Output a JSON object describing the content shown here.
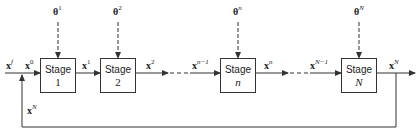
{
  "diagram": {
    "type": "multistage-process-flow",
    "stages": [
      {
        "label": "Stage",
        "index": "1",
        "italic": false,
        "input_param": {
          "base": "θ",
          "sup": "1"
        }
      },
      {
        "label": "Stage",
        "index": "2",
        "italic": false,
        "input_param": {
          "base": "θ",
          "sup": "2"
        }
      },
      {
        "label": "Stage",
        "index": "n",
        "italic": true,
        "input_param": {
          "base": "θ",
          "sup": "n"
        }
      },
      {
        "label": "Stage",
        "index": "N",
        "italic": true,
        "input_param": {
          "base": "θ",
          "sup": "N"
        }
      }
    ],
    "signals": {
      "feed": {
        "base": "x",
        "sup": "f"
      },
      "x0": {
        "base": "x",
        "sup": "0"
      },
      "x1": {
        "base": "x",
        "sup": "1"
      },
      "x2": {
        "base": "x",
        "sup": "2"
      },
      "xn_minus_1": {
        "base": "x",
        "sup": "n−1"
      },
      "xn": {
        "base": "x",
        "sup": "n"
      },
      "xN_minus_1": {
        "base": "x",
        "sup": "N−1"
      },
      "xN_out": {
        "base": "x",
        "sup": "N"
      },
      "xN_recycle": {
        "base": "x",
        "sup": "N"
      }
    },
    "colors": {
      "line": "#333333",
      "text": "#222222",
      "background": "#ffffff"
    }
  }
}
